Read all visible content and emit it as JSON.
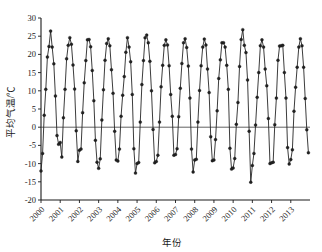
{
  "figure": {
    "background_color": "#ffffff",
    "line_color": "#262626",
    "marker_color": "#222222",
    "axis_color": "#1a1a1a"
  },
  "chart_data": {
    "type": "line",
    "title": "",
    "xlabel": "年份",
    "ylabel": "平均气温/℃",
    "ylim": [
      -20,
      30
    ],
    "yticks": [
      -20,
      -15,
      -10,
      -5,
      0,
      5,
      10,
      15,
      20,
      25,
      30
    ],
    "ytick_labels": [
      "-20",
      "-15",
      "-10",
      "-5",
      "0",
      "5",
      "10",
      "15",
      "20",
      "25",
      "30"
    ],
    "xlim": [
      2000,
      2014
    ],
    "xticks": [
      2000,
      2001,
      2002,
      2003,
      2004,
      2005,
      2006,
      2007,
      2008,
      2009,
      2010,
      2011,
      2012,
      2013
    ],
    "xtick_labels": [
      "2000",
      "2001",
      "2002",
      "2003",
      "2004",
      "2005",
      "2006",
      "2007",
      "2008",
      "2009",
      "2010",
      "2011",
      "2012",
      "2013"
    ],
    "grid": false,
    "legend": false,
    "marker": "filled-circle",
    "x_unit": "month",
    "series": [
      {
        "name": "平均气温",
        "x": [
          2000.0,
          2000.083,
          2000.167,
          2000.25,
          2000.333,
          2000.417,
          2000.5,
          2000.583,
          2000.667,
          2000.75,
          2000.833,
          2000.917,
          2001.0,
          2001.083,
          2001.167,
          2001.25,
          2001.333,
          2001.417,
          2001.5,
          2001.583,
          2001.667,
          2001.75,
          2001.833,
          2001.917,
          2002.0,
          2002.083,
          2002.167,
          2002.25,
          2002.333,
          2002.417,
          2002.5,
          2002.583,
          2002.667,
          2002.75,
          2002.833,
          2002.917,
          2003.0,
          2003.083,
          2003.167,
          2003.25,
          2003.333,
          2003.417,
          2003.5,
          2003.583,
          2003.667,
          2003.75,
          2003.833,
          2003.917,
          2004.0,
          2004.083,
          2004.167,
          2004.25,
          2004.333,
          2004.417,
          2004.5,
          2004.583,
          2004.667,
          2004.75,
          2004.833,
          2004.917,
          2005.0,
          2005.083,
          2005.167,
          2005.25,
          2005.333,
          2005.417,
          2005.5,
          2005.583,
          2005.667,
          2005.75,
          2005.833,
          2005.917,
          2006.0,
          2006.083,
          2006.167,
          2006.25,
          2006.333,
          2006.417,
          2006.5,
          2006.583,
          2006.667,
          2006.75,
          2006.833,
          2006.917,
          2007.0,
          2007.083,
          2007.167,
          2007.25,
          2007.333,
          2007.417,
          2007.5,
          2007.583,
          2007.667,
          2007.75,
          2007.833,
          2007.917,
          2008.0,
          2008.083,
          2008.167,
          2008.25,
          2008.333,
          2008.417,
          2008.5,
          2008.583,
          2008.667,
          2008.75,
          2008.833,
          2008.917,
          2009.0,
          2009.083,
          2009.167,
          2009.25,
          2009.333,
          2009.417,
          2009.5,
          2009.583,
          2009.667,
          2009.75,
          2009.833,
          2009.917,
          2010.0,
          2010.083,
          2010.167,
          2010.25,
          2010.333,
          2010.417,
          2010.5,
          2010.583,
          2010.667,
          2010.75,
          2010.833,
          2010.917,
          2011.0,
          2011.083,
          2011.167,
          2011.25,
          2011.333,
          2011.417,
          2011.5,
          2011.583,
          2011.667,
          2011.75,
          2011.833,
          2011.917,
          2012.0,
          2012.083,
          2012.167,
          2012.25,
          2012.333,
          2012.417,
          2012.5,
          2012.583,
          2012.667,
          2012.75,
          2012.833,
          2012.917,
          2013.0,
          2013.083,
          2013.167,
          2013.25,
          2013.333,
          2013.417,
          2013.5,
          2013.583,
          2013.667,
          2013.75,
          2013.833,
          2013.917
        ],
        "values": [
          -12.0,
          -7.2,
          3.3,
          10.4,
          19.3,
          22.2,
          26.4,
          22.0,
          17.4,
          8.6,
          -2.3,
          -4.7,
          -4.2,
          -8.2,
          2.6,
          10.4,
          18.8,
          22.5,
          24.6,
          22.8,
          17.1,
          10.5,
          -1.0,
          -9.4,
          -6.3,
          -6.0,
          4.0,
          12.2,
          18.3,
          24.0,
          24.1,
          22.1,
          15.6,
          7.3,
          -3.6,
          -9.6,
          -11.3,
          -8.7,
          2.0,
          10.3,
          18.4,
          23.0,
          24.3,
          22.4,
          15.8,
          9.3,
          -1.1,
          -9.0,
          -9.3,
          -6.0,
          3.0,
          8.8,
          13.9,
          20.6,
          24.6,
          22.0,
          18.0,
          9.0,
          -5.9,
          -12.6,
          -10.0,
          -9.7,
          1.4,
          11.7,
          18.3,
          24.6,
          25.3,
          23.2,
          18.1,
          10.0,
          -0.6,
          -9.8,
          -9.4,
          -7.7,
          1.4,
          11.1,
          17.0,
          22.5,
          24.0,
          22.6,
          16.9,
          9.0,
          3.0,
          -7.7,
          -7.5,
          -5.9,
          2.9,
          10.7,
          17.5,
          23.2,
          24.3,
          21.9,
          16.8,
          8.0,
          -6.0,
          -12.3,
          -9.0,
          -8.8,
          1.4,
          10.1,
          16.9,
          22.0,
          24.2,
          22.6,
          16.0,
          9.5,
          -2.6,
          -9.2,
          -9.0,
          -3.4,
          4.5,
          13.4,
          18.5,
          23.2,
          23.2,
          22.0,
          17.0,
          10.4,
          -5.8,
          -11.5,
          -11.2,
          -8.6,
          0.8,
          6.8,
          16.7,
          24.1,
          26.8,
          22.5,
          20.5,
          13.0,
          -1.1,
          -15.1,
          -10.5,
          -7.2,
          0.6,
          8.2,
          15.0,
          22.4,
          24.0,
          22.0,
          16.0,
          11.4,
          2.4,
          -10.0,
          -9.8,
          -9.6,
          0.7,
          8.0,
          18.4,
          22.3,
          22.4,
          22.5,
          15.0,
          8.0,
          -5.6,
          -10.1,
          -8.9,
          -6.2,
          4.4,
          11.0,
          16.5,
          22.0,
          24.3,
          22.4,
          16.5,
          7.9,
          -0.7,
          -7.0
        ]
      }
    ]
  }
}
